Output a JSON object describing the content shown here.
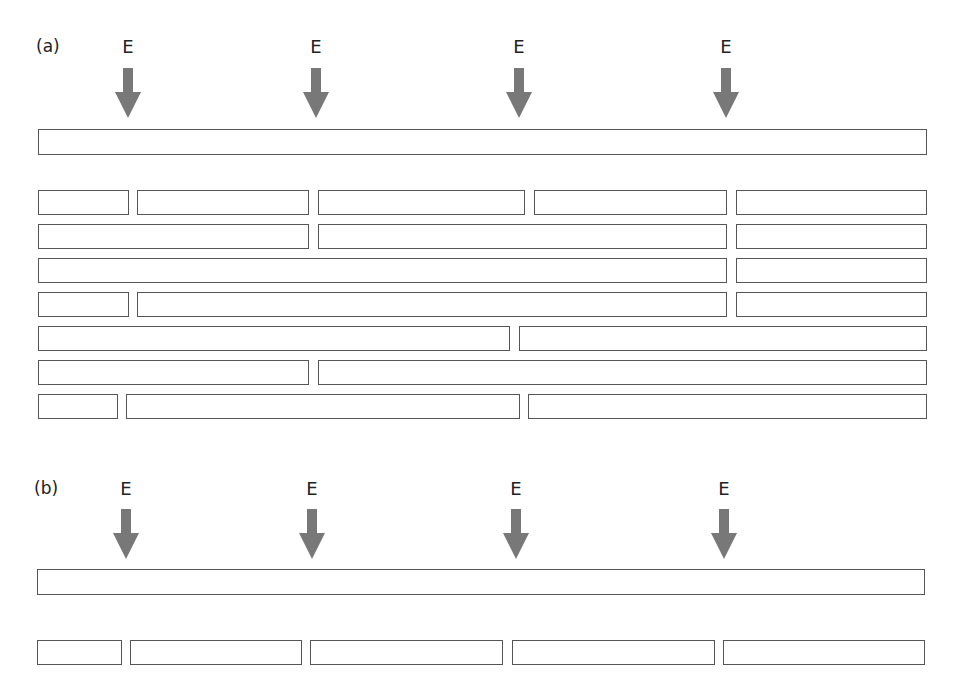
{
  "colors": {
    "arrow": "#787878",
    "outline": "#555555"
  },
  "panel_a": {
    "label": "(a)",
    "arrows": [
      {
        "label": "E",
        "x": 128
      },
      {
        "label": "E",
        "x": 316
      },
      {
        "label": "E",
        "x": 519
      },
      {
        "label": "E",
        "x": 726
      }
    ],
    "genome": {
      "x": 38,
      "y": 129,
      "w": 889,
      "h": 26
    },
    "fragment_rows": [
      [
        [
          38,
          129
        ],
        [
          137,
          309
        ],
        [
          318,
          525
        ],
        [
          534,
          727
        ],
        [
          736,
          927
        ]
      ],
      [
        [
          38,
          309
        ],
        [
          318,
          727
        ],
        [
          736,
          927
        ]
      ],
      [
        [
          38,
          727
        ],
        [
          736,
          927
        ]
      ],
      [
        [
          38,
          129
        ],
        [
          137,
          727
        ],
        [
          736,
          927
        ]
      ],
      [
        [
          38,
          510
        ],
        [
          519,
          927
        ]
      ],
      [
        [
          38,
          309
        ],
        [
          318,
          927
        ]
      ],
      [
        [
          38,
          118
        ],
        [
          126,
          520
        ],
        [
          528,
          927
        ]
      ]
    ],
    "row_y": [
      190,
      224,
      258,
      292,
      326,
      360,
      394
    ],
    "row_h": 25
  },
  "panel_b": {
    "label": "(b)",
    "arrows": [
      {
        "label": "E",
        "x": 126
      },
      {
        "label": "E",
        "x": 312
      },
      {
        "label": "E",
        "x": 516
      },
      {
        "label": "E",
        "x": 724
      }
    ],
    "genome": {
      "x": 37,
      "y": 569,
      "w": 888,
      "h": 26
    },
    "fragment_rows": [
      [
        [
          37,
          122
        ],
        [
          130,
          302
        ],
        [
          310,
          503
        ],
        [
          512,
          715
        ],
        [
          723,
          925
        ]
      ]
    ],
    "row_y": [
      640
    ],
    "row_h": 25
  }
}
